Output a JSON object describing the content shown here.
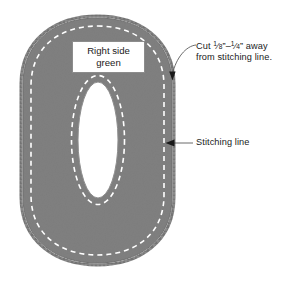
{
  "figure": {
    "kind": "sewing-pattern-diagram",
    "background_color": "#ffffff",
    "shape": {
      "name": "number-zero-applique",
      "fill_color": "#808080",
      "edge_color": "#6f6f6f",
      "outer_bounds": {
        "x": 23,
        "y": 18,
        "width": 149,
        "height": 245
      },
      "inner_hole": {
        "cx": 98,
        "cy": 140,
        "rx": 20,
        "ry": 58
      },
      "stitching_line": {
        "color": "#ffffff",
        "style": "dashed",
        "inset_px": 8
      }
    },
    "box_label": {
      "line1": "Right side",
      "line2": "green",
      "background_color": "#ffffff",
      "border_color": "#8c8c8c"
    },
    "annotations": [
      {
        "id": "cut-allowance",
        "line1_prefix": "Cut ",
        "fraction1_num": "1",
        "fraction1_den": "8",
        "inch_mark_1": "”",
        "dash": "–",
        "fraction2_num": "1",
        "fraction2_den": "4",
        "inch_mark_2": "”",
        "line1_suffix": " away",
        "line2": "from stitching line.",
        "leader": "curved",
        "arrow_target": {
          "x": 172,
          "y": 78
        }
      },
      {
        "id": "stitching-line",
        "text": "Stitching line",
        "leader": "straight",
        "arrow_target": {
          "x": 170,
          "y": 143
        }
      }
    ],
    "colors": {
      "fabric_gray": "#808080",
      "stitch_white": "#ffffff",
      "text_black": "#1a1a1a",
      "leader_gray": "#5a5a5a"
    }
  }
}
